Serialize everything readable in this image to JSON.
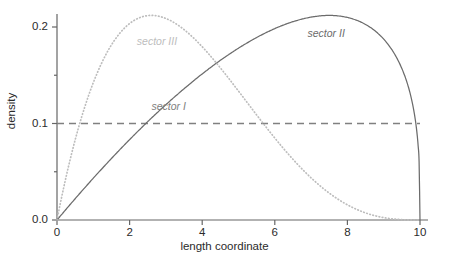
{
  "chart_data": {
    "type": "line",
    "title": "",
    "subtitle": "",
    "xlabel": "length coordinate",
    "ylabel": "density",
    "xlim": [
      0,
      10
    ],
    "ylim": [
      0.0,
      0.22
    ],
    "grid": false,
    "legend_position": "inline-annotations",
    "x_ticks": [
      {
        "value": 0,
        "label": "0"
      },
      {
        "value": 2,
        "label": "2"
      },
      {
        "value": 4,
        "label": "4"
      },
      {
        "value": 6,
        "label": "6"
      },
      {
        "value": 8,
        "label": "8"
      },
      {
        "value": 10,
        "label": "10"
      }
    ],
    "y_ticks": [
      {
        "value": 0.0,
        "label": "0.0"
      },
      {
        "value": 0.05,
        "label": ""
      },
      {
        "value": 0.1,
        "label": "0.1"
      },
      {
        "value": 0.15,
        "label": ""
      },
      {
        "value": 0.2,
        "label": "0.2"
      }
    ],
    "series": [
      {
        "name": "sector I",
        "style": "dashed",
        "color": "#808080",
        "constant_value": 0.1,
        "x": [
          0,
          10
        ],
        "values": [
          0.1,
          0.1
        ],
        "annotation": {
          "text": "sector I",
          "x": 2.6,
          "y": 0.116
        }
      },
      {
        "name": "sector II",
        "style": "solid",
        "color": "#6b6b6b",
        "peak_x": 7.5,
        "peak_y": 0.212,
        "x": [
          0,
          0.5,
          1,
          1.5,
          2,
          2.5,
          3,
          3.5,
          4,
          4.5,
          5,
          5.5,
          6,
          6.5,
          7,
          7.5,
          8,
          8.5,
          9,
          9.5,
          10
        ],
        "values": [
          0.0,
          0.0016,
          0.0055,
          0.0115,
          0.0196,
          0.0297,
          0.0417,
          0.0553,
          0.0702,
          0.0859,
          0.1019,
          0.1176,
          0.1322,
          0.1448,
          0.1543,
          0.1595,
          0.1586,
          0.1493,
          0.1283,
          0.0898,
          0.0
        ]
      },
      {
        "name": "sector III",
        "style": "dotted",
        "color": "#bdbdbd",
        "peak_x": 2.6,
        "peak_y": 0.212,
        "x": [
          0,
          0.5,
          1,
          1.5,
          2,
          2.5,
          3,
          3.5,
          4,
          4.5,
          5,
          5.5,
          6,
          6.5,
          7,
          7.5,
          8,
          8.5,
          9,
          9.5,
          10
        ],
        "values": [
          0.0,
          0.0898,
          0.1283,
          0.1493,
          0.1586,
          0.1595,
          0.1543,
          0.1448,
          0.1322,
          0.1176,
          0.1019,
          0.0859,
          0.0702,
          0.0553,
          0.0417,
          0.0297,
          0.0196,
          0.0115,
          0.0055,
          0.0016,
          0.0
        ]
      }
    ],
    "annotations": [
      {
        "text": "sector I",
        "x": 2.6,
        "y": 0.116
      },
      {
        "text": "sector III",
        "x": 2.2,
        "y": 0.183
      },
      {
        "text": "sector II",
        "x": 6.9,
        "y": 0.192
      }
    ],
    "axis_color": "#666666"
  }
}
